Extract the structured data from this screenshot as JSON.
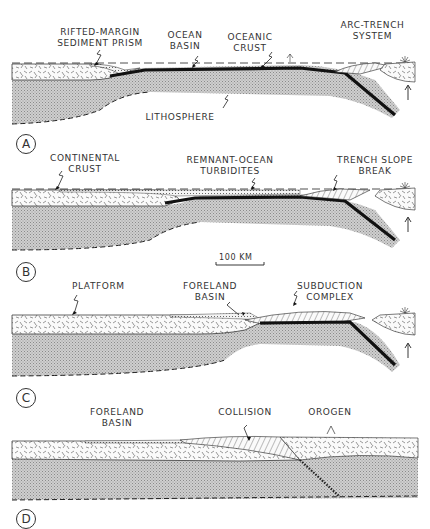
{
  "figure": {
    "scale_bar": "100 KM"
  },
  "panels": [
    {
      "letter": "A",
      "labels": {
        "rifted_margin": [
          "RIFTED-MARGIN",
          "SEDIMENT PRISM"
        ],
        "ocean_basin": [
          "OCEAN",
          "BASIN"
        ],
        "oceanic_crust": [
          "OCEANIC",
          "CRUST"
        ],
        "arc_trench": [
          "ARC-TRENCH",
          "SYSTEM"
        ],
        "lithosphere": "LITHOSPHERE"
      }
    },
    {
      "letter": "B",
      "labels": {
        "continental_crust": [
          "CONTINENTAL",
          "CRUST"
        ],
        "remnant_ocean": [
          "REMNANT-OCEAN",
          "TURBIDITES"
        ],
        "trench_slope": [
          "TRENCH SLOPE",
          "BREAK"
        ]
      }
    },
    {
      "letter": "C",
      "labels": {
        "platform": "PLATFORM",
        "foreland_basin": [
          "FORELAND",
          "BASIN"
        ],
        "subduction_complex": [
          "SUBDUCTION",
          "COMPLEX"
        ]
      }
    },
    {
      "letter": "D",
      "labels": {
        "foreland_basin": [
          "FORELAND",
          "BASIN"
        ],
        "collision": "COLLISION",
        "orogen": "OROGEN"
      }
    }
  ],
  "colors": {
    "ink": "#222222",
    "lithosphere_fill": "#bdbdbd",
    "background": "#ffffff"
  }
}
